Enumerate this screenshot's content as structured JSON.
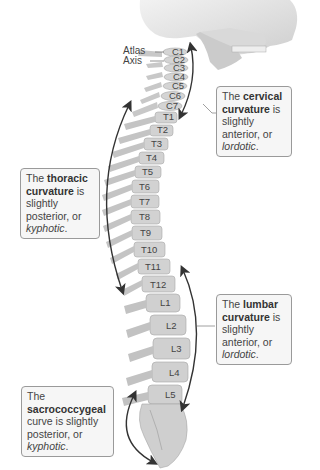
{
  "diagram": {
    "side_labels": {
      "atlas": "Atlas",
      "axis": "Axis"
    },
    "vertebrae": {
      "cervical": [
        "C1",
        "C2",
        "C3",
        "C4",
        "C5",
        "C6",
        "C7"
      ],
      "thoracic": [
        "T1",
        "T2",
        "T3",
        "T4",
        "T5",
        "T6",
        "T7",
        "T8",
        "T9",
        "T10",
        "T11",
        "T12"
      ],
      "lumbar": [
        "L1",
        "L2",
        "L3",
        "L4",
        "L5"
      ]
    },
    "callouts": {
      "cervical": {
        "pre": "The ",
        "bold": "cervical curvature",
        "mid": " is slightly anterior, or ",
        "italic": "lordotic",
        "post": "."
      },
      "thoracic": {
        "pre": "The ",
        "bold": "thoracic curvature",
        "mid": " is slightly posterior, or ",
        "italic": "kyphotic",
        "post": "."
      },
      "lumbar": {
        "pre": "The ",
        "bold": "lumbar curvature",
        "mid": " is slightly anterior, or ",
        "italic": "lordotic",
        "post": "."
      },
      "sacrococcygeal": {
        "pre": "The ",
        "bold": "sacrococcygeal",
        "mid": " curve is slightly posterior, or ",
        "italic": "kyphotic",
        "post": "."
      }
    },
    "colors": {
      "bone": "#d6d6d6",
      "bone_shadow": "#b8b8b8",
      "callout_bg": "#f6f6f6",
      "callout_border": "#9a9a9a",
      "arrow": "#333333",
      "text": "#444444"
    }
  }
}
